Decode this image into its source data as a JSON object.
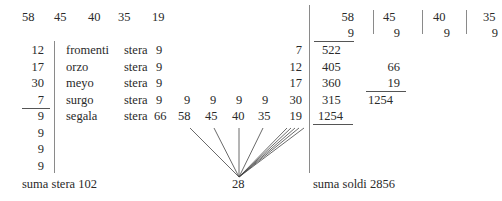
{
  "top_row": [
    "58",
    "45",
    "40",
    "35",
    "19"
  ],
  "left_column": [
    "12",
    "17",
    "30",
    "7",
    "9",
    "9",
    "9",
    "9"
  ],
  "rows": [
    {
      "name": "fromenti",
      "unit": "stera",
      "value": "9",
      "right": "7"
    },
    {
      "name": "orzo",
      "unit": "stera",
      "value": "9",
      "right": "12"
    },
    {
      "name": "meyo",
      "unit": "stera",
      "value": "9",
      "right": "17"
    },
    {
      "name": "surgo",
      "unit": "stera",
      "value": "9",
      "extra": [
        "9",
        "9",
        "9",
        "9"
      ],
      "right": "30"
    },
    {
      "name": "segala",
      "unit": "stera",
      "value": "66",
      "extra": [
        "58",
        "45",
        "40",
        "35"
      ],
      "right": "19"
    }
  ],
  "sum_stera": "suma stera 102",
  "center_value": "28",
  "sum_soldi": "suma soldi 2856",
  "right_block": {
    "header": [
      {
        "top": "58",
        "bottom": "9"
      },
      {
        "top": "45",
        "bottom": "9"
      },
      {
        "top": "40",
        "bottom": "9"
      },
      {
        "top": "35",
        "bottom": "9"
      }
    ],
    "products": [
      "522",
      "405",
      "360",
      "315",
      "1254"
    ],
    "side_sum": [
      "66",
      "19",
      "1254"
    ]
  }
}
